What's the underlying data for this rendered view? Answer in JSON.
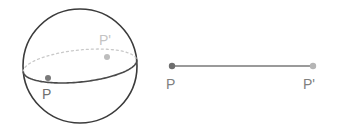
{
  "figure": {
    "background_color": "#ffffff",
    "width": 339,
    "height": 135,
    "colors": {
      "outline_dark": "#3b3b3b",
      "equator_front": "#4a4a4a",
      "equator_back_dashed": "#c9c9c9",
      "point_near": "#7a7a7a",
      "point_far": "#bdbdbd",
      "label_near": "#707070",
      "label_far": "#c4c4c4",
      "segment_line": "#9a9a9a",
      "segment_point_left": "#6e6e6e",
      "segment_point_right": "#b5b5b5",
      "segment_label": "#808080"
    },
    "sphere": {
      "center_x": 80,
      "center_y": 66,
      "radius": 57,
      "equator": {
        "tilt_degrees": -6,
        "semi_major": 57,
        "semi_minor": 16,
        "front_style": "solid",
        "back_style": "dashed",
        "dash_pattern": "2 3"
      },
      "points": [
        {
          "id": "sphere-point-p",
          "label": "P",
          "label_x": 42,
          "label_y": 99,
          "dot_x": 48,
          "dot_y": 78,
          "dot_radius": 3,
          "depth": "front"
        },
        {
          "id": "sphere-point-p-prime",
          "label": "P'",
          "label_x": 99,
          "label_y": 45,
          "dot_x": 107,
          "dot_y": 57,
          "dot_radius": 3,
          "depth": "back"
        }
      ]
    },
    "segment": {
      "x1": 172,
      "y1": 66,
      "x2": 313,
      "y2": 66,
      "stroke_width": 2,
      "endpoints": [
        {
          "id": "segment-point-p",
          "label": "P",
          "label_x": 166,
          "label_y": 89,
          "dot_x": 172,
          "dot_y": 66,
          "dot_radius": 3.2
        },
        {
          "id": "segment-point-p-prime",
          "label": "P'",
          "label_x": 303,
          "label_y": 89,
          "dot_x": 313,
          "dot_y": 66,
          "dot_radius": 3.2
        }
      ]
    },
    "label_font_size": 14
  }
}
